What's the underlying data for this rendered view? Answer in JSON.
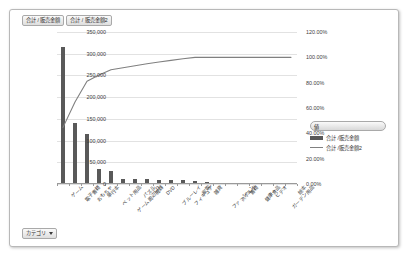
{
  "chart_object": {
    "series_buttons": [
      {
        "label": "合計 / 販売金額"
      },
      {
        "label": "合計 / 販売金額2"
      }
    ],
    "category_button": {
      "label": "カテゴリ"
    }
  },
  "legend": {
    "header": "値",
    "items": [
      {
        "label": "合計 /販売金額",
        "marker": "bar",
        "color": "#595959"
      },
      {
        "label": "合計 /販売金額2",
        "marker": "line",
        "color": "#808080"
      }
    ]
  },
  "chart_data": {
    "type": "bar",
    "title": "",
    "subtitle": "",
    "xlabel": "",
    "ylabel": "",
    "y2label": "",
    "grid": true,
    "legend_position": "right",
    "categories": [
      "ゲーム",
      "電子書籍",
      "おもちゃ",
      "単行本",
      "ペット用品",
      "ゲーム周辺機器",
      "パズル",
      "CD",
      "DVD",
      "ブルーレイ",
      "フィギュア",
      "家電",
      "雑貨",
      "ファッション",
      "スポーツ",
      "書籍",
      "健康食品",
      "ビデオ",
      "ガーデン用品",
      "絵本"
    ],
    "ylim": [
      0,
      350000
    ],
    "yticks": [
      0,
      50000,
      100000,
      150000,
      200000,
      250000,
      300000,
      350000
    ],
    "ytick_labels": [
      "0",
      "50,000",
      "100,000",
      "150,000",
      "200,000",
      "250,000",
      "300,000",
      "350,000"
    ],
    "y2lim": [
      0,
      1.2
    ],
    "y2ticks": [
      0,
      0.2,
      0.4,
      0.6,
      0.8,
      1.0,
      1.2
    ],
    "y2tick_labels": [
      "0.00%",
      "20.00%",
      "40.00%",
      "60.00%",
      "80.00%",
      "100.00%",
      "120.00%"
    ],
    "series": [
      {
        "name": "合計 /販売金額",
        "type": "bar",
        "axis": "left",
        "color": "#595959",
        "values": [
          315000,
          141000,
          116000,
          35000,
          29000,
          11500,
          11000,
          10500,
          10000,
          9500,
          9000,
          8000,
          5000,
          2500,
          1500,
          1200,
          900,
          600,
          400,
          200
        ]
      },
      {
        "name": "合計 /販売金額2",
        "type": "line",
        "axis": "right",
        "color": "#808080",
        "values": [
          0.447,
          0.647,
          0.811,
          0.861,
          0.902,
          0.918,
          0.934,
          0.949,
          0.963,
          0.976,
          0.989,
          1.0,
          1.0,
          1.0,
          1.0,
          1.0,
          1.0,
          1.0,
          1.0,
          1.0
        ]
      }
    ]
  }
}
